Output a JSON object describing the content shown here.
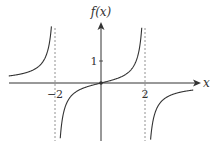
{
  "chart_data": {
    "type": "line",
    "title": "",
    "function": "f(x) = x / (4 - x^2)",
    "xlabel": "x",
    "ylabel": "f(x)",
    "x_ticks": [
      {
        "value": -2,
        "label": "−2"
      },
      {
        "value": 2,
        "label": "2"
      }
    ],
    "y_ticks": [
      {
        "value": 1,
        "label": "1"
      }
    ],
    "asymptotes": [
      -2,
      2
    ],
    "xlim": [
      -4.1,
      4.1
    ],
    "ylim": [
      -2.6,
      2.7
    ],
    "grid": false,
    "legend": null,
    "series": [
      {
        "name": "left branch",
        "x": [
          -4.1,
          -3.5,
          -3,
          -2.5,
          -2.2
        ],
        "values": [
          0.32,
          0.43,
          0.6,
          1.11,
          2.62
        ]
      },
      {
        "name": "middle branch",
        "x": [
          -1.85,
          -1.5,
          -1,
          -0.5,
          0,
          0.5,
          1,
          1.5,
          1.85
        ],
        "values": [
          -3.2,
          -0.86,
          -0.33,
          -0.13,
          0,
          0.13,
          0.33,
          0.86,
          3.2
        ]
      },
      {
        "name": "right branch",
        "x": [
          2.2,
          2.5,
          3,
          3.5,
          4.1
        ],
        "values": [
          -2.62,
          -1.11,
          -0.6,
          -0.43,
          -0.32
        ]
      }
    ],
    "points": [
      {
        "x": 0,
        "y": 0
      }
    ]
  },
  "labels": {
    "y_axis": "f(x)",
    "x_axis": "x",
    "tick_neg2": "−2",
    "tick_2": "2",
    "tick_1": "1"
  }
}
